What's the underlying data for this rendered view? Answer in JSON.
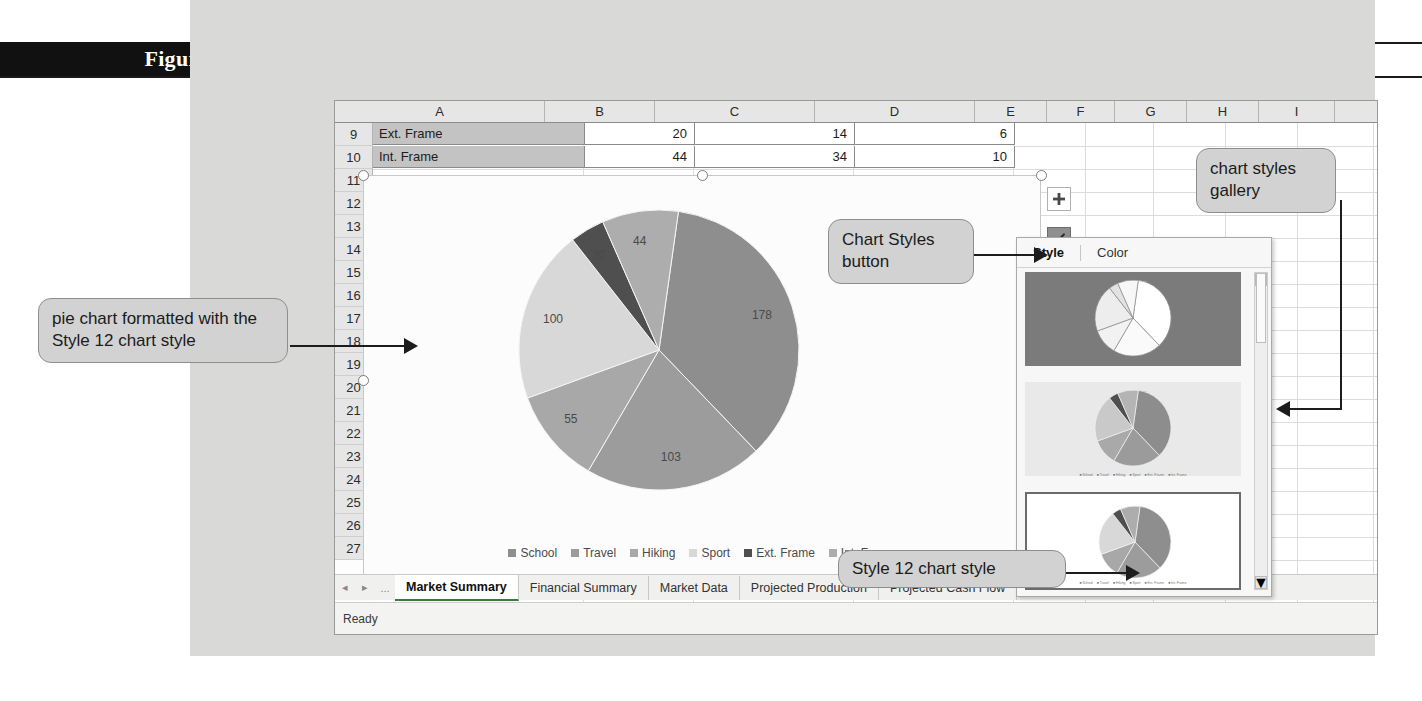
{
  "figure": {
    "number": "Figure 4-12",
    "title": "Chart Styles gallery"
  },
  "spreadsheet": {
    "columns": [
      "A",
      "B",
      "C",
      "D",
      "E",
      "F",
      "G",
      "H",
      "I"
    ],
    "rows": [
      "9",
      "10",
      "11",
      "12",
      "13",
      "14",
      "15",
      "16",
      "17",
      "18",
      "19",
      "20",
      "21",
      "22",
      "23",
      "24",
      "25",
      "26",
      "27"
    ],
    "data_rows": [
      {
        "row": "9",
        "a": "Ext. Frame",
        "b": "20",
        "c": "14",
        "d": "6"
      },
      {
        "row": "10",
        "a": "Int. Frame",
        "b": "44",
        "c": "34",
        "d": "10"
      }
    ],
    "sheet_tabs": [
      {
        "label": "Market Summary",
        "active": true
      },
      {
        "label": "Financial Summary",
        "active": false
      },
      {
        "label": "Market Data",
        "active": false
      },
      {
        "label": "Projected Production",
        "active": false
      },
      {
        "label": "Projected Cash Flow",
        "active": false
      }
    ],
    "tab_nav": {
      "prev": "◂",
      "next": "▸",
      "ellipsis": "..."
    },
    "status": "Ready"
  },
  "chart_buttons": [
    {
      "name": "chart-elements-button",
      "glyph": "+",
      "active": false
    },
    {
      "name": "chart-styles-button",
      "glyph": "brush",
      "active": true
    },
    {
      "name": "chart-filters-button",
      "glyph": "funnel",
      "active": false
    }
  ],
  "gallery": {
    "tabs": [
      {
        "label": "Style",
        "selected": true
      },
      {
        "label": "Color",
        "selected": false
      }
    ],
    "scrollbar": {
      "up": "▲",
      "down": "▼"
    },
    "thumbnails": [
      {
        "name": "style-thumbnail-dark",
        "selected": false
      },
      {
        "name": "style-thumbnail-hatched",
        "selected": false
      },
      {
        "name": "style-thumbnail-style12",
        "selected": true
      }
    ]
  },
  "callouts": [
    {
      "name": "callout-pie-chart-style12",
      "text": "pie chart formatted with the Style 12 chart style"
    },
    {
      "name": "callout-chart-styles-button",
      "text": "Chart Styles button"
    },
    {
      "name": "callout-chart-styles-gallery",
      "text": "chart styles gallery"
    },
    {
      "name": "callout-style-12",
      "text": "Style 12 chart style"
    }
  ],
  "chart_data": {
    "type": "pie",
    "title": "",
    "categories": [
      "School",
      "Travel",
      "Hiking",
      "Sport",
      "Ext. Frame",
      "Int. Frame"
    ],
    "values": [
      178,
      103,
      55,
      100,
      20,
      44
    ],
    "data_labels": [
      "178",
      "103",
      "55",
      "100",
      "20",
      "44"
    ],
    "legend": [
      "School",
      "Travel",
      "Hiking",
      "Sport",
      "Ext. Frame",
      "Int. Frame"
    ],
    "legend_position": "bottom",
    "colors": [
      "#8e8e8e",
      "#9c9c9c",
      "#a8a8a8",
      "#d8d8d8",
      "#4f4f4f",
      "#adadad"
    ],
    "grid": false
  }
}
